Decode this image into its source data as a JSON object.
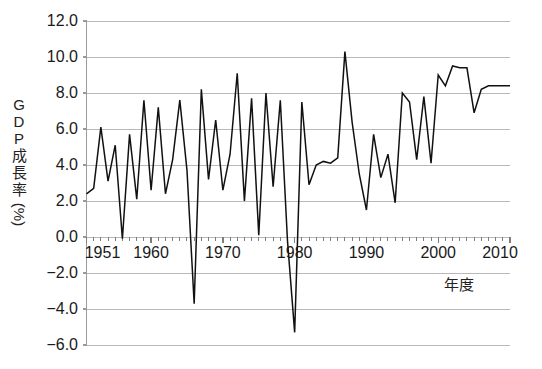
{
  "chart_data": {
    "type": "line",
    "title": "",
    "xlabel": "年度",
    "ylabel": "GDP成長率(%)",
    "ylabel_chars": [
      "G",
      "D",
      "P",
      "成",
      "長",
      "率",
      "(%)"
    ],
    "xlim": [
      1951,
      2010
    ],
    "ylim": [
      -6.0,
      12.0
    ],
    "grid": true,
    "legend": null,
    "y_ticks": [
      "12.0",
      "10.0",
      "8.0",
      "6.0",
      "4.0",
      "2.0",
      "0.0",
      "-2.0",
      "-4.0",
      "-6.0"
    ],
    "y_tick_values": [
      12.0,
      10.0,
      8.0,
      6.0,
      4.0,
      2.0,
      0.0,
      -2.0,
      -4.0,
      -6.0
    ],
    "x_ticks": [
      "1951",
      "1960",
      "1970",
      "1980",
      "1990",
      "2000",
      "2010"
    ],
    "x_tick_values": [
      1951,
      1960,
      1970,
      1980,
      1990,
      2000,
      2010
    ],
    "line_color": "#111111",
    "grid_color": "#b9b9b9",
    "axis_color": "#9a9a9a",
    "x": [
      1951,
      1952,
      1953,
      1954,
      1955,
      1956,
      1957,
      1958,
      1959,
      1960,
      1961,
      1962,
      1963,
      1964,
      1965,
      1966,
      1967,
      1968,
      1969,
      1970,
      1971,
      1972,
      1973,
      1974,
      1975,
      1976,
      1977,
      1978,
      1979,
      1980,
      1981,
      1982,
      1983,
      1984,
      1985,
      1986,
      1987,
      1988,
      1989,
      1990,
      1991,
      1992,
      1993,
      1994,
      1995,
      1996,
      1997,
      1998,
      1999,
      2000,
      2001,
      2002,
      2003,
      2004,
      2005,
      2006,
      2007,
      2008,
      2009,
      2010
    ],
    "values": [
      2.4,
      2.7,
      6.1,
      3.1,
      5.1,
      -0.1,
      5.7,
      2.1,
      7.6,
      2.6,
      7.2,
      2.4,
      4.3,
      7.6,
      3.7,
      -3.7,
      8.2,
      3.2,
      6.5,
      2.6,
      4.6,
      9.1,
      2.0,
      7.7,
      0.1,
      8.0,
      2.8,
      7.6,
      -0.2,
      -5.3,
      7.5,
      2.9,
      4.0,
      4.2,
      4.1,
      4.4,
      10.3,
      6.4,
      3.5,
      1.5,
      5.7,
      3.3,
      4.6,
      1.9,
      8.0,
      7.5,
      4.3,
      7.8,
      4.1,
      9.0,
      8.4,
      9.5,
      9.4,
      9.4,
      6.9,
      8.2,
      8.4,
      8.4,
      8.4,
      8.4
    ],
    "series_name": "GDP成長率"
  }
}
